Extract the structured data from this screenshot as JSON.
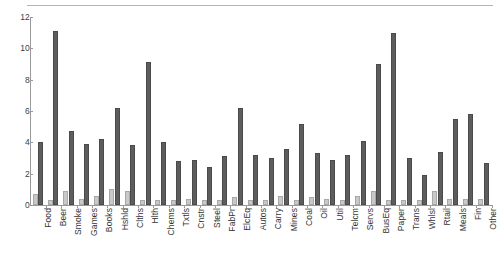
{
  "chart_data": {
    "type": "bar",
    "title": "",
    "subtitle": "",
    "xlabel": "",
    "ylabel": "",
    "ylim": [
      0,
      12
    ],
    "yticks": [
      0,
      2,
      4,
      6,
      8,
      10,
      12
    ],
    "ytick_labels": [
      "0",
      "2",
      "4",
      "6",
      "8",
      "10",
      "12"
    ],
    "grid": false,
    "legend": "none",
    "orientation": "vertical",
    "categories": [
      "Food",
      "Beer",
      "Smoke",
      "Games",
      "Books",
      "Hshld",
      "Clths",
      "Hlth",
      "Chems",
      "Txtls",
      "Cnstr",
      "Steel",
      "FabPr",
      "ElcEq",
      "Autos",
      "Carry",
      "Mines",
      "Coal",
      "Oil",
      "Util",
      "Telcm",
      "Servs",
      "BusEq",
      "Paper",
      "Trans",
      "Whlsl",
      "Rtail",
      "Meals",
      "Fin",
      "Other"
    ],
    "series": [
      {
        "name": "series-1",
        "color": "#c9c9c9",
        "values": [
          0.7,
          0.3,
          0.9,
          0.4,
          0.6,
          1.0,
          0.9,
          0.3,
          0.3,
          0.3,
          0.4,
          0.3,
          0.3,
          0.5,
          0.3,
          0.3,
          0.6,
          0.3,
          0.5,
          0.4,
          0.3,
          0.6,
          0.9,
          0.3,
          0.3,
          0.3,
          0.9,
          0.4,
          0.4,
          0.4
        ]
      },
      {
        "name": "series-2",
        "color": "#5d5d5d",
        "values": [
          4.0,
          11.1,
          4.7,
          3.9,
          4.2,
          6.2,
          3.8,
          9.1,
          4.0,
          2.8,
          2.9,
          2.4,
          3.1,
          6.2,
          3.2,
          3.0,
          3.6,
          5.2,
          3.3,
          2.9,
          3.2,
          4.1,
          9.0,
          11.0,
          3.0,
          1.9,
          3.4,
          5.5,
          5.8,
          2.7
        ]
      }
    ],
    "tall_note_values": {
      "Beer": 11.1,
      "BusEq": 11.0,
      "Hlth": 9.1,
      "Paper": 9.0
    }
  },
  "figure": {
    "background_color": "#ffffff",
    "axis_color": "#9a9a9a",
    "text_color": "#333333"
  }
}
